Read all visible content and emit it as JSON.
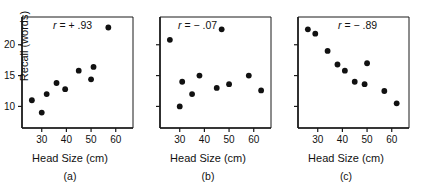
{
  "figure": {
    "caption_letters": [
      "(a)",
      "(b)",
      "(c)"
    ],
    "axis_x_label": "Head Size (cm)",
    "axis_y_label": "Recall (words)",
    "point_color": "#111111",
    "axis_color": "#1a1a1a",
    "background": "#ffffff"
  },
  "chart_data": [
    {
      "type": "scatter",
      "title": "",
      "annotation": "r = + .93",
      "annotation_parts": {
        "symbol": "r",
        "equals": "=",
        "value": "+ .93"
      },
      "panel_label": "(a)",
      "xlabel": "Head Size (cm)",
      "ylabel": "Recall (words)",
      "xlim": [
        22,
        67
      ],
      "ylim": [
        6.5,
        24.5
      ],
      "xticks": [
        30,
        40,
        50,
        60
      ],
      "yticks": [
        10,
        15,
        20
      ],
      "grid": false,
      "legend": "none",
      "correlation": 0.93,
      "x": [
        26,
        30,
        32,
        36,
        39.5,
        45,
        50,
        51,
        57
      ],
      "y": [
        11.0,
        9.0,
        12.0,
        13.8,
        12.8,
        15.8,
        14.4,
        16.4,
        22.8
      ]
    },
    {
      "type": "scatter",
      "title": "",
      "annotation": "r = − .07",
      "annotation_parts": {
        "symbol": "r",
        "equals": "=",
        "value": "− .07"
      },
      "panel_label": "(b)",
      "xlabel": "Head Size (cm)",
      "ylabel": "Recall (words)",
      "xlim": [
        22,
        67
      ],
      "ylim": [
        6.5,
        24.5
      ],
      "xticks": [
        30,
        40,
        50,
        60
      ],
      "yticks": [
        10,
        15,
        20
      ],
      "grid": false,
      "legend": "none",
      "correlation": -0.07,
      "x": [
        26,
        30,
        31,
        35,
        38,
        45,
        47,
        50,
        58,
        63
      ],
      "y": [
        20.8,
        10.0,
        14.0,
        12.0,
        15.0,
        13.0,
        22.5,
        13.6,
        15.0,
        12.6
      ]
    },
    {
      "type": "scatter",
      "title": "",
      "annotation": "r = − .89",
      "annotation_parts": {
        "symbol": "r",
        "equals": "=",
        "value": "− .89"
      },
      "panel_label": "(c)",
      "xlabel": "Head Size (cm)",
      "ylabel": "Recall (words)",
      "xlim": [
        22,
        67
      ],
      "ylim": [
        6.5,
        24.5
      ],
      "xticks": [
        30,
        40,
        50,
        60
      ],
      "yticks": [
        10,
        15,
        20
      ],
      "grid": false,
      "legend": "none",
      "correlation": -0.89,
      "x": [
        26,
        29,
        34,
        38,
        41,
        45,
        49,
        50,
        57,
        62
      ],
      "y": [
        22.5,
        21.8,
        19.0,
        16.8,
        15.8,
        14.0,
        13.6,
        17.0,
        12.5,
        10.5
      ]
    }
  ],
  "panels": [
    {
      "id": "a",
      "letter": "(a)",
      "r_symbol": "r",
      "r_body": " =  + .93",
      "xlabel": "Head Size (cm)",
      "ylabel": "Recall (words)",
      "xtick_labels": [
        "30",
        "40",
        "50",
        "60"
      ],
      "ytick_labels": [
        "20",
        "15",
        "10"
      ],
      "show_y_axis_labels": true
    },
    {
      "id": "b",
      "letter": "(b)",
      "r_symbol": "r",
      "r_body": " =  − .07",
      "xlabel": "Head Size (cm)",
      "ylabel": "Recall (words)",
      "xtick_labels": [
        "30",
        "40",
        "50",
        "60"
      ],
      "ytick_labels": [],
      "show_y_axis_labels": false
    },
    {
      "id": "c",
      "letter": "(c)",
      "r_symbol": "r",
      "r_body": " =  − .89",
      "xlabel": "Head Size (cm)",
      "ylabel": "Recall (words)",
      "xtick_labels": [
        "30",
        "40",
        "50",
        "60"
      ],
      "ytick_labels": [],
      "show_y_axis_labels": false
    }
  ]
}
